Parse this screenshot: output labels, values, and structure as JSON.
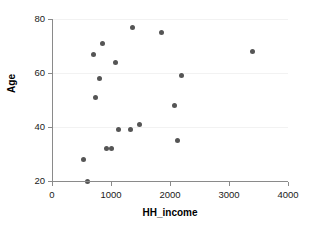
{
  "chart_data": {
    "type": "scatter",
    "title": "",
    "xlabel": "HH_income",
    "ylabel": "Age",
    "xlim": [
      0,
      4000
    ],
    "ylim": [
      20,
      80
    ],
    "xticks": [
      0,
      1000,
      2000,
      3000,
      4000
    ],
    "yticks": [
      20,
      40,
      60,
      80
    ],
    "grid": true,
    "grid_axis": "y",
    "legend": null,
    "marker_color": "#555555",
    "axis_color": "#8a8a8a",
    "grid_color": "#f2f2f2",
    "background": "#ffffff",
    "series": [
      {
        "name": "observations",
        "points": [
          {
            "x": 530,
            "y": 28
          },
          {
            "x": 610,
            "y": 20
          },
          {
            "x": 700,
            "y": 67
          },
          {
            "x": 740,
            "y": 51
          },
          {
            "x": 810,
            "y": 58
          },
          {
            "x": 860,
            "y": 71
          },
          {
            "x": 930,
            "y": 32
          },
          {
            "x": 1000,
            "y": 32
          },
          {
            "x": 1070,
            "y": 64
          },
          {
            "x": 1120,
            "y": 39
          },
          {
            "x": 1330,
            "y": 39
          },
          {
            "x": 1360,
            "y": 77
          },
          {
            "x": 1480,
            "y": 41
          },
          {
            "x": 1860,
            "y": 75
          },
          {
            "x": 2080,
            "y": 48
          },
          {
            "x": 2120,
            "y": 35
          },
          {
            "x": 2200,
            "y": 59
          },
          {
            "x": 3400,
            "y": 68
          }
        ]
      }
    ]
  }
}
